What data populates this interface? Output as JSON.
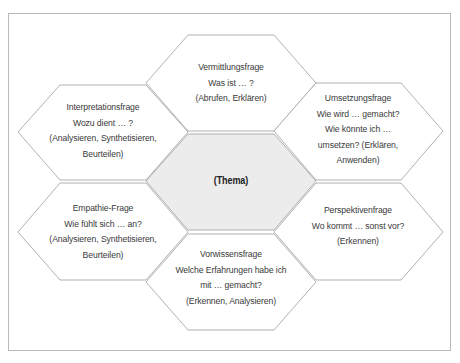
{
  "diagram": {
    "type": "hexagon-cluster",
    "colors": {
      "frame_border": "#b9b9b9",
      "hex_stroke": "#a8a8a8",
      "hex_fill": "#ffffff",
      "center_fill": "#ececec",
      "text": "#3a3a3a"
    },
    "center": {
      "label": "(Thema)"
    },
    "hexagons": [
      {
        "id": "top",
        "title": "Vermittlungsfrage",
        "question": "Was ist … ?",
        "skills": "(Abrufen, Erklären)"
      },
      {
        "id": "upper-left",
        "title": "Interpretationsfrage",
        "question": "Wozu dient … ?",
        "skills_line1": "(Analysieren, Synthetisieren,",
        "skills_line2": "Beurteilen)"
      },
      {
        "id": "upper-right",
        "title": "Umsetzungsfrage",
        "question_line1": "Wie wird … gemacht?",
        "question_line2": "Wie könnte ich …",
        "question_line3": "umsetzen? (Erklären,",
        "skills": "Anwenden)"
      },
      {
        "id": "lower-left",
        "title": "Empathie-Frage",
        "question": "Wie fühlt sich … an?",
        "skills_line1": "(Analysieren, Synthetisieren,",
        "skills_line2": "Beurteilen)"
      },
      {
        "id": "lower-right",
        "title": "Perspektivenfrage",
        "question": "Wo kommt … sonst vor?",
        "skills": "(Erkennen)"
      },
      {
        "id": "bottom",
        "title": "Vorwissensfrage",
        "question_line1": "Welche Erfahrungen habe ich",
        "question_line2": "mit … gemacht?",
        "skills": "(Erkennen, Analysieren)"
      }
    ]
  }
}
